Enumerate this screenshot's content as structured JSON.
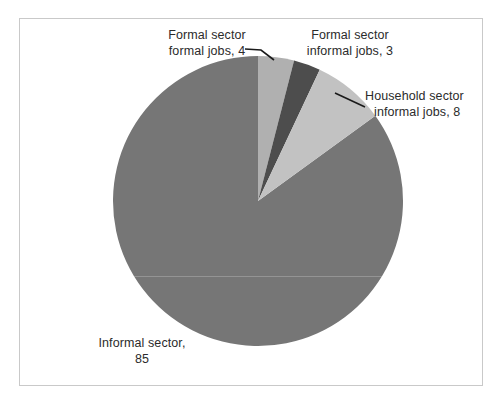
{
  "chart_data": {
    "type": "pie",
    "title": "",
    "subtitle": "",
    "xlabel": "",
    "ylabel": "",
    "legend_position": "none",
    "grid": false,
    "start_angle_deg": 0,
    "direction": "clockwise",
    "total": 100,
    "categories": [
      "Formal sector formal jobs",
      "Formal sector informal jobs",
      "Household sector informal jobs",
      "Informal sector"
    ],
    "values": [
      4,
      3,
      8,
      85
    ],
    "colors": [
      "#b0b0b0",
      "#4d4d4d",
      "#c2c2c2",
      "#767676"
    ],
    "data_labels": [
      "Formal sector formal jobs, 4",
      "Formal sector informal jobs, 3",
      "Household sector informal jobs, 8",
      "Informal sector, 85"
    ],
    "slices": [
      {
        "name": "Formal sector formal jobs",
        "value": 4,
        "color": "#b0b0b0",
        "label_line1": "Formal sector",
        "label_line2": "formal jobs, 4",
        "start_deg": 0,
        "end_deg": 14.4,
        "leader_line": true
      },
      {
        "name": "Formal sector informal jobs",
        "value": 3,
        "color": "#4d4d4d",
        "label_line1": "Formal sector",
        "label_line2": "informal jobs, 3",
        "start_deg": 14.4,
        "end_deg": 25.2,
        "leader_line": false
      },
      {
        "name": "Household sector informal jobs",
        "value": 8,
        "color": "#c2c2c2",
        "label_line1": "Household sector",
        "label_line2": "informal jobs, 8",
        "start_deg": 25.2,
        "end_deg": 54.0,
        "leader_line": true
      },
      {
        "name": "Informal sector",
        "value": 85,
        "color": "#767676",
        "label_line1": "Informal sector,",
        "label_line2": "85",
        "start_deg": 54.0,
        "end_deg": 360.0,
        "leader_line": false
      }
    ]
  },
  "labels": {
    "formal_formal": {
      "line1": "Formal sector",
      "line2": "formal jobs, 4"
    },
    "formal_informal": {
      "line1": "Formal sector",
      "line2": "informal jobs, 3"
    },
    "household": {
      "line1": "Household sector",
      "line2": "informal jobs, 8"
    },
    "informal": {
      "line1": "Informal sector,",
      "line2": "85"
    }
  },
  "style": {
    "frame_border_color": "#c9c9c9",
    "background": "#ffffff",
    "text_color": "#2b2b2b",
    "leader_line_color": "#1a1a1a"
  }
}
